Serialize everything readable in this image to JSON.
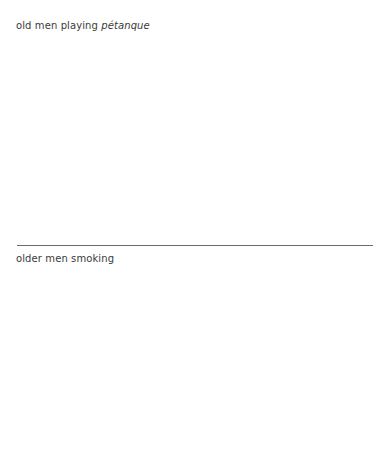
{
  "captions": {
    "top": {
      "text": "old men playing ",
      "emphasis": "pétanque"
    },
    "bottom": {
      "text": "older men smoking"
    }
  },
  "colors": {
    "text": "#3a3a3a",
    "divider": "#6a6a6a",
    "background": "#ffffff"
  }
}
